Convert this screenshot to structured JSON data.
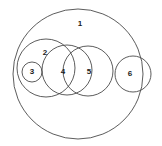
{
  "diagram": {
    "background_color": "#ffffff",
    "stroke_color": "#4a4a4a",
    "label_color": "#1b1b1b",
    "viewbox": {
      "width": 162,
      "height": 146
    },
    "circles": [
      {
        "id": "circle-1",
        "label": "1",
        "cx": 78,
        "cy": 74,
        "r": 65,
        "label_x": 80,
        "label_y": 24
      },
      {
        "id": "circle-2",
        "label": "2",
        "cx": 46,
        "cy": 68,
        "r": 29,
        "label_x": 45,
        "label_y": 53
      },
      {
        "id": "circle-3",
        "label": "3",
        "cx": 32,
        "cy": 72,
        "r": 10,
        "label_x": 32,
        "label_y": 72
      },
      {
        "id": "circle-4",
        "label": "4",
        "cx": 67,
        "cy": 70,
        "r": 25,
        "label_x": 63,
        "label_y": 72
      },
      {
        "id": "circle-5",
        "label": "5",
        "cx": 88,
        "cy": 71,
        "r": 25,
        "label_x": 89,
        "label_y": 72
      },
      {
        "id": "circle-6",
        "label": "6",
        "cx": 133,
        "cy": 74,
        "r": 18,
        "label_x": 130,
        "label_y": 74
      }
    ]
  }
}
